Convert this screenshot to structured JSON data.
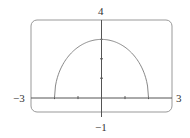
{
  "chart_data": {
    "type": "line",
    "title": "",
    "xlabel": "",
    "ylabel": "",
    "xlim": [
      -3,
      3
    ],
    "ylim": [
      -1,
      4
    ],
    "grid": false,
    "x_tick_marks": [
      -2,
      -1,
      0,
      1,
      2
    ],
    "y_tick_marks": [
      1,
      2,
      3
    ],
    "labels": {
      "xmin": "−3",
      "xmax": "3",
      "ymax": "4",
      "ymin": "−1"
    },
    "series": [
      {
        "name": "curve",
        "description": "upper half-ellipse y = 3*sqrt(1 - x^2/4)",
        "x": [
          -2,
          -1.5,
          -1,
          -0.5,
          0,
          0.5,
          1,
          1.5,
          2
        ],
        "y": [
          0,
          1.98,
          2.6,
          2.9,
          3,
          2.9,
          2.6,
          1.98,
          0
        ]
      }
    ],
    "colors": {
      "curve": "#888888",
      "frame": "#999999",
      "axes": "#555555"
    }
  }
}
